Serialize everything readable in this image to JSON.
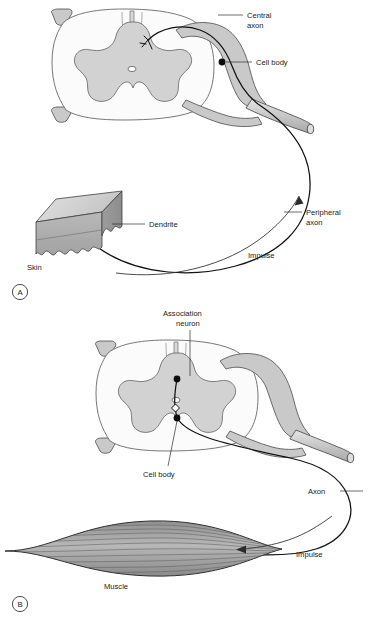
{
  "figure": {
    "background_color": "#ffffff",
    "ink_color": "#1a1a1a",
    "gray_matter_color": "#d2d2d2",
    "white_matter_color": "#fbfbfb",
    "nerve_color": "#c9c9c9"
  },
  "panels": [
    {
      "id": "A",
      "letter": "A",
      "subject": "sensory-neuron",
      "labels": {
        "central_axon_line1": "Central",
        "central_axon_line2": "axon",
        "cell_body": "Cell body",
        "peripheral_axon_line1": "Peripheral",
        "peripheral_axon_line2": "axon",
        "dendrite": "Dendrite",
        "skin": "Skin",
        "impulse": "Impulse"
      }
    },
    {
      "id": "B",
      "letter": "B",
      "subject": "motor-neuron",
      "labels": {
        "association_neuron_line1": "Association",
        "association_neuron_line2": "neuron",
        "cell_body": "Cell body",
        "axon": "Axon",
        "impulse": "Impulse",
        "muscle": "Muscle"
      }
    }
  ]
}
